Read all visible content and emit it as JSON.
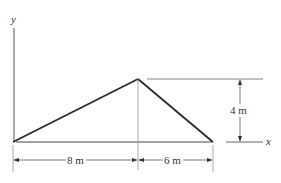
{
  "diagram": {
    "axis_labels": {
      "y": "y",
      "x": "x"
    },
    "dimensions": {
      "horizontal_left": "8 m",
      "horizontal_right": "6 m",
      "vertical": "4 m"
    },
    "colors": {
      "stroke": "#2a2a2a",
      "thin": "#555555",
      "background": "#ffffff"
    }
  }
}
